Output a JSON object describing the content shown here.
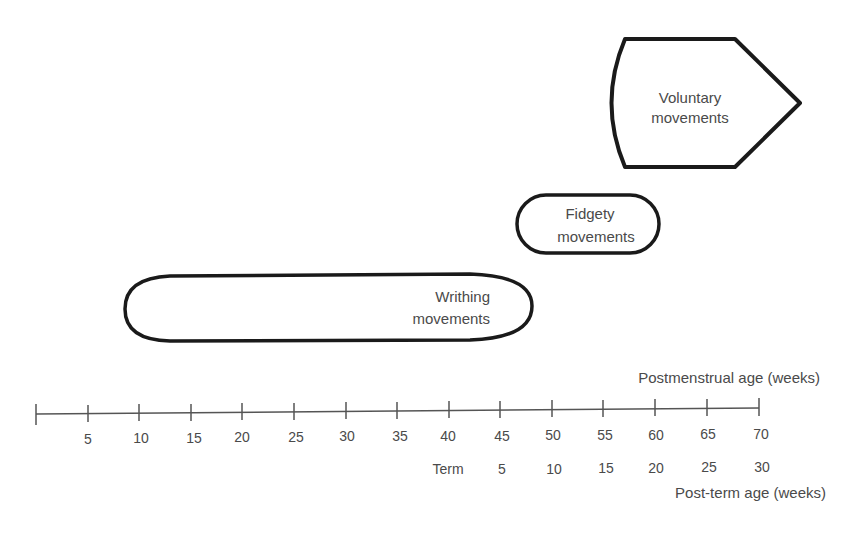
{
  "diagram": {
    "shapes": {
      "voluntary": {
        "line1": "Voluntary",
        "line2": "movements"
      },
      "fidgety": {
        "line1": "Fidgety",
        "line2": "movements"
      },
      "writhing": {
        "line1": "Writhing",
        "line2": "movements"
      }
    },
    "axis": {
      "top_label": "Postmenstrual age (weeks)",
      "bottom_label": "Post-term age (weeks)",
      "postmenstrual_ticks": [
        "5",
        "10",
        "15",
        "20",
        "25",
        "30",
        "35",
        "40",
        "45",
        "50",
        "55",
        "60",
        "65",
        "70"
      ],
      "postterm_ticks": [
        "Term",
        "5",
        "10",
        "15",
        "20",
        "25",
        "30"
      ]
    },
    "colors": {
      "stroke": "#1a1a1a",
      "text": "#4a4a4a",
      "axis": "#555555"
    }
  }
}
